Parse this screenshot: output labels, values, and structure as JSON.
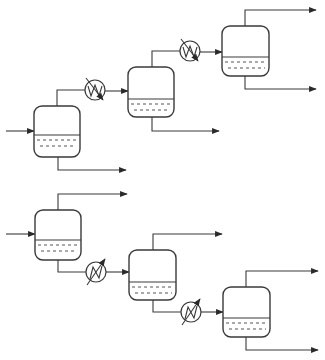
{
  "diagram": {
    "type": "process-flow-diagram",
    "colors": {
      "stroke": "#3a3a3a",
      "background": "#ffffff"
    },
    "trains": [
      {
        "name": "top-train",
        "vessels": [
          {
            "id": "V1",
            "x": 34,
            "y": 106,
            "w": 46,
            "h": 51,
            "liquid_y": 135,
            "feed_y": 131
          },
          {
            "id": "V2",
            "x": 128,
            "y": 67,
            "w": 46,
            "h": 50,
            "liquid_y": 99
          },
          {
            "id": "V3",
            "x": 222,
            "y": 26,
            "w": 47,
            "h": 50,
            "liquid_y": 57
          }
        ],
        "heat_exchangers": [
          {
            "id": "E1",
            "cx": 95,
            "cy": 90,
            "r": 10,
            "style": "cooler"
          },
          {
            "id": "E2",
            "cx": 190,
            "cy": 51,
            "r": 10,
            "style": "cooler"
          }
        ]
      },
      {
        "name": "bottom-train",
        "vessels": [
          {
            "id": "V4",
            "x": 35,
            "y": 210,
            "w": 46,
            "h": 50,
            "liquid_y": 240,
            "feed_y": 234
          },
          {
            "id": "V5",
            "x": 129,
            "y": 250,
            "w": 47,
            "h": 50,
            "liquid_y": 282
          },
          {
            "id": "V6",
            "x": 223,
            "y": 287,
            "w": 47,
            "h": 50,
            "liquid_y": 318
          }
        ],
        "heat_exchangers": [
          {
            "id": "E3",
            "cx": 96,
            "cy": 272,
            "r": 10,
            "style": "heater"
          },
          {
            "id": "E4",
            "cx": 191,
            "cy": 312,
            "r": 10,
            "style": "heater"
          }
        ]
      }
    ]
  }
}
